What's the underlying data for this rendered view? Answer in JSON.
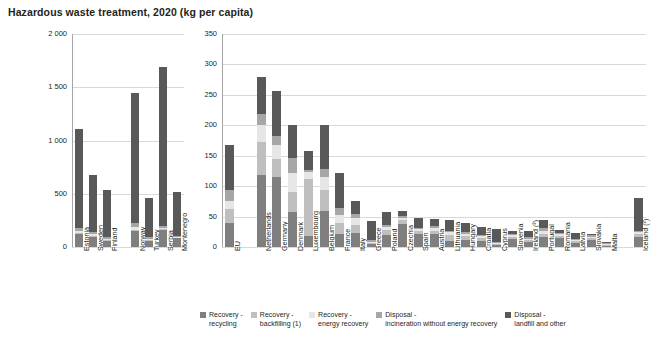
{
  "title": "Hazardous waste treatment, 2020 (kg per capita)",
  "legend": [
    {
      "key": "recycling",
      "label": "Recovery -\nrecycling",
      "color": "#7f7f7f"
    },
    {
      "key": "backfilling",
      "label": "Recovery -\nbackfilling (1)",
      "color": "#bfbfbf"
    },
    {
      "key": "energy",
      "label": "Recovery -\nenergy  recovery",
      "color": "#e6e6e6"
    },
    {
      "key": "incineration",
      "label": "Disposal -\nincineration without energy recovery",
      "color": "#a6a6a6"
    },
    {
      "key": "landfill",
      "label": "Disposal -\nlandfill and other",
      "color": "#595959"
    }
  ],
  "chart_data": [
    {
      "type": "bar",
      "id": "left-panel",
      "stacked": true,
      "title": "Hazardous waste treatment, 2020 (kg per capita)",
      "xlabel": "",
      "ylabel": "",
      "ylim": [
        0,
        2000
      ],
      "yticks": [
        0,
        500,
        1000,
        1500,
        2000
      ],
      "ytick_labels": [
        "0",
        "500",
        "1 000",
        "1 500",
        "2 000"
      ],
      "grid": true,
      "categories": [
        "Estonia",
        "Sweden",
        "Finland",
        "",
        "Norway",
        "Turkey",
        "Serbia",
        "Montenegro"
      ],
      "series": [
        {
          "name": "Recovery - recycling",
          "values": [
            120,
            95,
            60,
            null,
            150,
            60,
            160,
            80
          ]
        },
        {
          "name": "Recovery - backfilling (1)",
          "values": [
            10,
            10,
            10,
            null,
            10,
            10,
            10,
            5
          ]
        },
        {
          "name": "Recovery - energy  recovery",
          "values": [
            20,
            15,
            10,
            null,
            25,
            10,
            10,
            5
          ]
        },
        {
          "name": "Disposal - incineration without energy recovery",
          "values": [
            30,
            20,
            15,
            null,
            40,
            15,
            20,
            10
          ]
        },
        {
          "name": "Disposal - landfill and other",
          "values": [
            930,
            540,
            445,
            null,
            1220,
            370,
            1490,
            410
          ]
        }
      ],
      "totals": [
        1110,
        680,
        540,
        null,
        1445,
        465,
        1690,
        510
      ]
    },
    {
      "type": "bar",
      "id": "right-panel",
      "stacked": true,
      "xlabel": "",
      "ylabel": "",
      "ylim": [
        0,
        350
      ],
      "yticks": [
        0,
        50,
        100,
        150,
        200,
        250,
        300,
        350
      ],
      "ytick_labels": [
        "0",
        "50",
        "100",
        "150",
        "200",
        "250",
        "300",
        "350"
      ],
      "grid": true,
      "categories": [
        "EU",
        "",
        "Netherlands",
        "Germany",
        "Denmark",
        "Luxembourg",
        "Belgium",
        "France",
        "Italy",
        "Greece",
        "Poland",
        "Czechia",
        "Spain",
        "Austria",
        "Lithuania",
        "Hungary",
        "Croatia",
        "Cyprus",
        "Slovenia",
        "Ireland (²)",
        "Portugal",
        "Romania",
        "Latvia",
        "Slovakia",
        "Malta",
        "",
        "Iceland (²)"
      ],
      "series": [
        {
          "name": "Recovery - recycling",
          "values": [
            40,
            null,
            118,
            115,
            58,
            18,
            60,
            22,
            23,
            5,
            20,
            38,
            22,
            22,
            10,
            12,
            10,
            3,
            13,
            9,
            16,
            14,
            7,
            12,
            2,
            null,
            16
          ]
        },
        {
          "name": "Recovery - backfilling (1)",
          "values": [
            22,
            null,
            55,
            30,
            33,
            93,
            33,
            17,
            14,
            2,
            8,
            6,
            4,
            5,
            10,
            6,
            5,
            2,
            4,
            3,
            6,
            4,
            3,
            3,
            1,
            null,
            5
          ]
        },
        {
          "name": "Recovery - energy  recovery",
          "values": [
            14,
            null,
            28,
            22,
            30,
            12,
            22,
            14,
            10,
            2,
            5,
            4,
            3,
            4,
            4,
            4,
            3,
            2,
            2,
            2,
            5,
            3,
            2,
            2,
            1,
            null,
            3
          ]
        },
        {
          "name": "Disposal - incineration without energy recovery",
          "values": [
            18,
            null,
            18,
            16,
            26,
            4,
            14,
            11,
            8,
            3,
            4,
            3,
            3,
            4,
            3,
            3,
            2,
            2,
            2,
            2,
            4,
            2,
            2,
            2,
            1,
            null,
            3
          ]
        },
        {
          "name": "Disposal - landfill and other",
          "values": [
            73,
            null,
            61,
            74,
            54,
            30,
            71,
            58,
            20,
            31,
            20,
            9,
            16,
            11,
            18,
            14,
            13,
            20,
            6,
            11,
            14,
            5,
            9,
            3,
            2,
            null,
            53
          ]
        }
      ],
      "totals": [
        167,
        null,
        280,
        257,
        201,
        157,
        200,
        122,
        75,
        43,
        57,
        60,
        48,
        46,
        45,
        39,
        33,
        29,
        27,
        27,
        45,
        28,
        23,
        22,
        7,
        null,
        80
      ]
    }
  ]
}
